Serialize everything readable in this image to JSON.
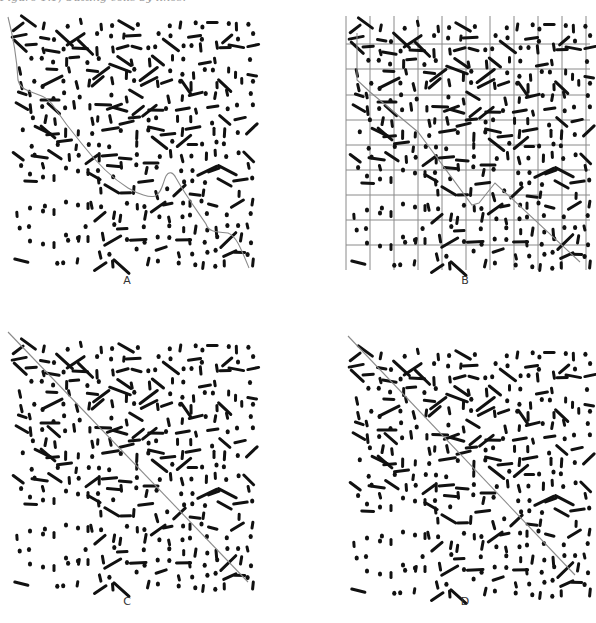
{
  "figure": {
    "caption": "Figure 1.1, Cutting cells by lines.",
    "panels": [
      {
        "id": "A",
        "label": "A",
        "boundary": "irregular-curve",
        "grid": false
      },
      {
        "id": "B",
        "label": "B",
        "boundary": "stepped-along-grid",
        "grid": true
      },
      {
        "id": "C",
        "label": "C",
        "boundary": "straight-diagonal",
        "grid": false
      },
      {
        "id": "D",
        "label": "D",
        "boundary": "straight-diagonal",
        "grid": false
      }
    ],
    "colors": {
      "marks": "#111111",
      "boundary_line": "#8a8a8a",
      "grid_line": "#8a8a8a",
      "label": "#333333"
    }
  }
}
